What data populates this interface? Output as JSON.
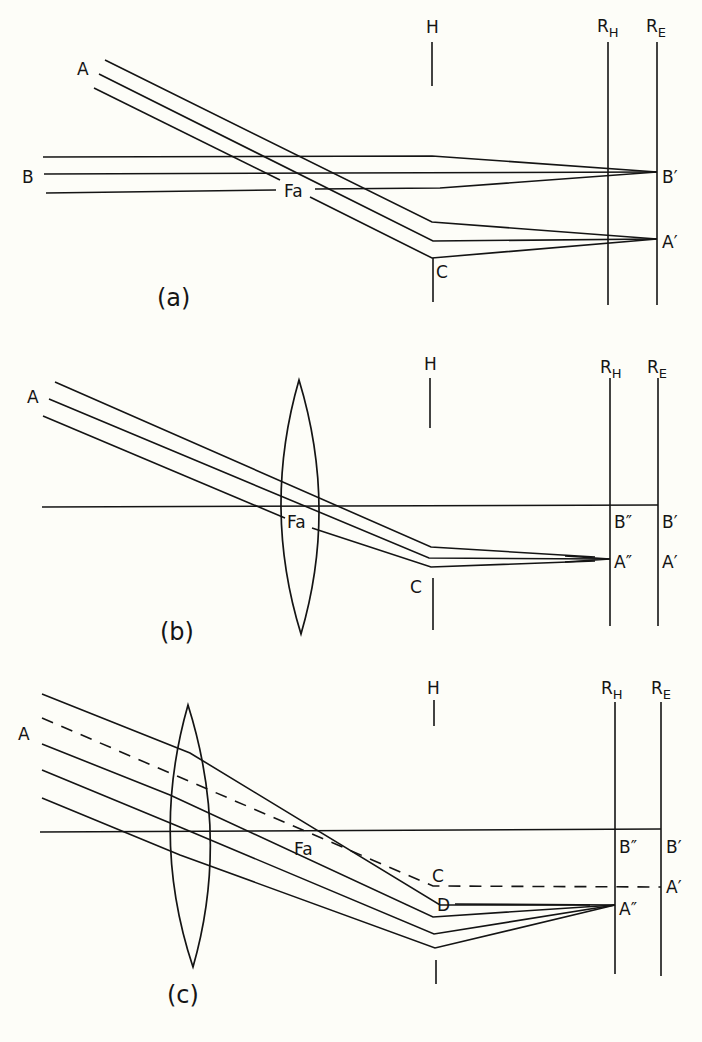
{
  "figure": {
    "panels": [
      {
        "id": "a",
        "caption": "(a)",
        "labels": {
          "A": "A",
          "B": "B",
          "Fa": "Fa",
          "C": "C",
          "H": "H",
          "RH_main": "R",
          "RH_sub": "H",
          "RE_main": "R",
          "RE_sub": "E",
          "B_prime": "B′",
          "A_prime": "A′"
        },
        "has_lens": false
      },
      {
        "id": "b",
        "caption": "(b)",
        "labels": {
          "A": "A",
          "Fa": "Fa",
          "C": "C",
          "H": "H",
          "RH_main": "R",
          "RH_sub": "H",
          "RE_main": "R",
          "RE_sub": "E",
          "B_double": "B″",
          "B_prime": "B′",
          "A_double": "A″",
          "A_prime": "A′"
        },
        "has_lens": true
      },
      {
        "id": "c",
        "caption": "(c)",
        "labels": {
          "A": "A",
          "Fa": "Fa",
          "C": "C",
          "D": "D",
          "H": "H",
          "RH_main": "R",
          "RH_sub": "H",
          "RE_main": "R",
          "RE_sub": "E",
          "B_double": "B″",
          "B_prime": "B′",
          "A_double": "A″",
          "A_prime": "A′"
        },
        "has_lens": true
      }
    ]
  }
}
